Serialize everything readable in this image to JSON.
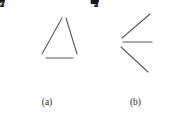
{
  "figure": {
    "background_color": "#ffffff",
    "edge_color": "#59595c",
    "text_color": "#17171a"
  },
  "panels": [
    {
      "id": "a",
      "caption": "(a)",
      "nodes": [
        {
          "id": "n1",
          "label": "1",
          "symbol": "♣",
          "symbol_name": "club-suit",
          "x": 64,
          "y": 12,
          "label_pos": "right"
        },
        {
          "id": "n2",
          "label": "2",
          "symbol": "♦",
          "symbol_name": "diamond-suit",
          "x": 42,
          "y": 58,
          "label_pos": "below-left"
        },
        {
          "id": "n4",
          "label": "4",
          "symbol": "♥",
          "symbol_name": "heart-suit",
          "x": 77,
          "y": 58,
          "label_pos": "below-right"
        },
        {
          "id": "n7",
          "label": "7",
          "symbol": "♦",
          "symbol_name": "diamond-suit",
          "x": 27,
          "y": 38,
          "label_pos": "left"
        }
      ],
      "edges": [
        {
          "from": "n1",
          "to": "n2",
          "weight": "3",
          "x1": 62,
          "y1": 18,
          "x2": 42,
          "y2": 54,
          "lx": 45,
          "ly": 31
        },
        {
          "from": "n1",
          "to": "n4",
          "weight": "5",
          "x1": 66,
          "y1": 18,
          "x2": 77,
          "y2": 54,
          "lx": 76,
          "ly": 31
        },
        {
          "from": "n2",
          "to": "n4",
          "weight": "6",
          "x1": 46,
          "y1": 58,
          "x2": 73,
          "y2": 58,
          "lx": 60,
          "ly": 70
        }
      ]
    },
    {
      "id": "b",
      "caption": "(b)",
      "nodes": [
        {
          "id": "n1",
          "label": "1",
          "symbol": "♣",
          "symbol_name": "club-suit",
          "x": 24,
          "y": 42,
          "label_pos": "left"
        },
        {
          "id": "n2",
          "label": "2",
          "symbol": "♦",
          "symbol_name": "diamond-suit",
          "x": 60,
          "y": 10,
          "label_pos": "right"
        },
        {
          "id": "n4",
          "label": "4",
          "symbol": "♥",
          "symbol_name": "heart-suit",
          "x": 62,
          "y": 42,
          "label_pos": "right"
        },
        {
          "id": "n7",
          "label": "7",
          "symbol": "■",
          "symbol_name": "filled-square",
          "x": 57,
          "y": 75,
          "label_pos": "right"
        }
      ],
      "edges": [
        {
          "from": "n1",
          "to": "n2",
          "weight": "3",
          "x1": 28,
          "y1": 38,
          "x2": 56,
          "y2": 14,
          "lx": 37,
          "ly": 21
        },
        {
          "from": "n1",
          "to": "n4",
          "weight": "5",
          "x1": 29,
          "y1": 42,
          "x2": 58,
          "y2": 42,
          "lx": 45,
          "ly": 33
        },
        {
          "from": "n1",
          "to": "n7",
          "weight": "6",
          "x1": 27,
          "y1": 47,
          "x2": 54,
          "y2": 72,
          "lx": 34,
          "ly": 63
        }
      ]
    }
  ]
}
